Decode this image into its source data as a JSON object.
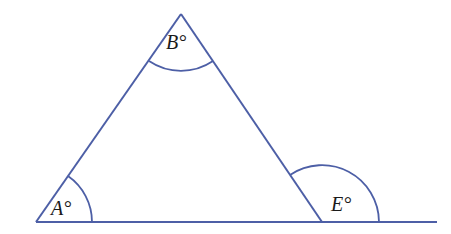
{
  "diagram": {
    "type": "triangle-with-exterior-angle",
    "stroke_color": "#4d5fa6",
    "background": "#ffffff",
    "vertices": {
      "A": {
        "x": 36,
        "y": 222
      },
      "B": {
        "x": 181,
        "y": 14
      },
      "C": {
        "x": 322,
        "y": 222
      }
    },
    "baseline_end": {
      "x": 437,
      "y": 222
    },
    "angles": [
      {
        "id": "A",
        "label": "A°",
        "kind": "interior"
      },
      {
        "id": "B",
        "label": "B°",
        "kind": "interior"
      },
      {
        "id": "E",
        "label": "E°",
        "kind": "exterior"
      }
    ]
  },
  "labels": {
    "angle_a": "A°",
    "angle_b": "B°",
    "angle_e": "E°"
  }
}
